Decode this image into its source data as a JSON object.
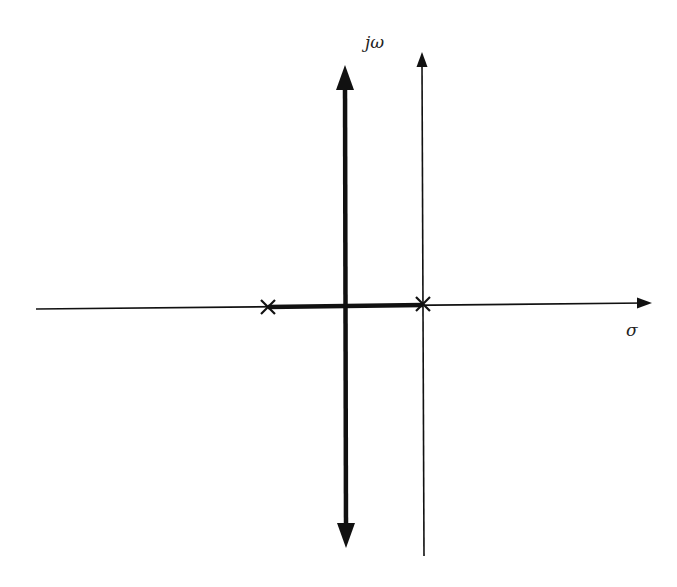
{
  "diagram": {
    "type": "root-locus",
    "axes": {
      "real_axis_label": "σ",
      "imaginary_axis_label": "jω"
    },
    "poles": [
      {
        "name": "pole-left",
        "marker": "x",
        "x": 268,
        "y": 307
      },
      {
        "name": "pole-origin",
        "marker": "x",
        "x": 423,
        "y": 304
      }
    ],
    "locus_branches": [
      {
        "name": "real-axis-segment",
        "from_pole": "pole-left",
        "to_pole": "pole-origin"
      },
      {
        "name": "vertical-asymptote-branch",
        "x": 345,
        "direction": "up-and-down"
      }
    ],
    "colors": {
      "line": "#111111",
      "background": "#ffffff"
    }
  }
}
